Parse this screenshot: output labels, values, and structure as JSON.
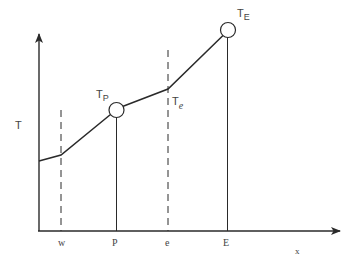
{
  "diagram": {
    "type": "temperature-profile",
    "y_axis_label": "T",
    "x_axis_label": "x",
    "x_ticks": [
      {
        "label": "w",
        "x": 61,
        "style": "dashed"
      },
      {
        "label": "P",
        "x": 117,
        "style": "solid"
      },
      {
        "label": "e",
        "x": 168,
        "style": "dashed"
      },
      {
        "label": "E",
        "x": 227,
        "style": "solid"
      }
    ],
    "nodes": [
      {
        "id": "P",
        "label_main": "T",
        "label_sub": "P",
        "cx": 116,
        "cy": 110
      },
      {
        "id": "E",
        "label_main": "T",
        "label_sub": "E",
        "cx": 228,
        "cy": 30
      }
    ],
    "face_labels": [
      {
        "id": "e",
        "label_main": "T",
        "label_sub": "e"
      }
    ],
    "profile_points": [
      [
        39,
        161
      ],
      [
        61,
        155
      ],
      [
        110,
        115
      ],
      [
        122,
        106
      ],
      [
        168,
        89
      ],
      [
        223,
        35
      ]
    ],
    "colors": {
      "line": "#2a2a2a",
      "text": "#444444",
      "background": "#ffffff"
    }
  }
}
